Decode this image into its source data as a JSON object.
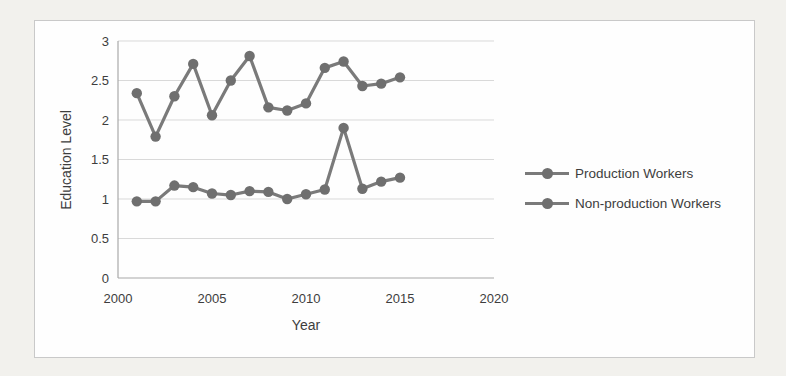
{
  "figure": {
    "page_background": "#f2f1ed",
    "box_background": "#fefefe",
    "box_border": "#c9c9c9"
  },
  "chart_data": {
    "type": "line",
    "title": "",
    "xlabel": "Year",
    "ylabel": "Education Level",
    "x": [
      2001,
      2002,
      2003,
      2004,
      2005,
      2006,
      2007,
      2008,
      2009,
      2010,
      2011,
      2012,
      2013,
      2014,
      2015
    ],
    "series": [
      {
        "name": "Production Workers",
        "values": [
          0.97,
          0.97,
          1.17,
          1.15,
          1.07,
          1.05,
          1.1,
          1.09,
          1.0,
          1.06,
          1.12,
          1.9,
          1.13,
          1.22,
          1.27
        ]
      },
      {
        "name": "Non-production Workers",
        "values": [
          2.34,
          1.79,
          2.3,
          2.71,
          2.06,
          2.5,
          2.81,
          2.16,
          2.12,
          2.21,
          2.66,
          2.74,
          2.43,
          2.46,
          2.54
        ]
      }
    ],
    "xlim": [
      2000,
      2020
    ],
    "ylim": [
      0,
      3
    ],
    "x_ticks": [
      "2000",
      "2005",
      "2010",
      "2015",
      "2020"
    ],
    "y_ticks": [
      "0",
      "0.5",
      "1",
      "1.5",
      "2",
      "2.5",
      "3"
    ],
    "grid": "horizontal",
    "marker": "circle",
    "legend_position": "right",
    "colors": {
      "series": "#7a7a7a",
      "marker": "#6f6f6f",
      "grid": "#d9d9d9",
      "axis": "#a8a8a8",
      "text": "#3d3d3d"
    }
  }
}
